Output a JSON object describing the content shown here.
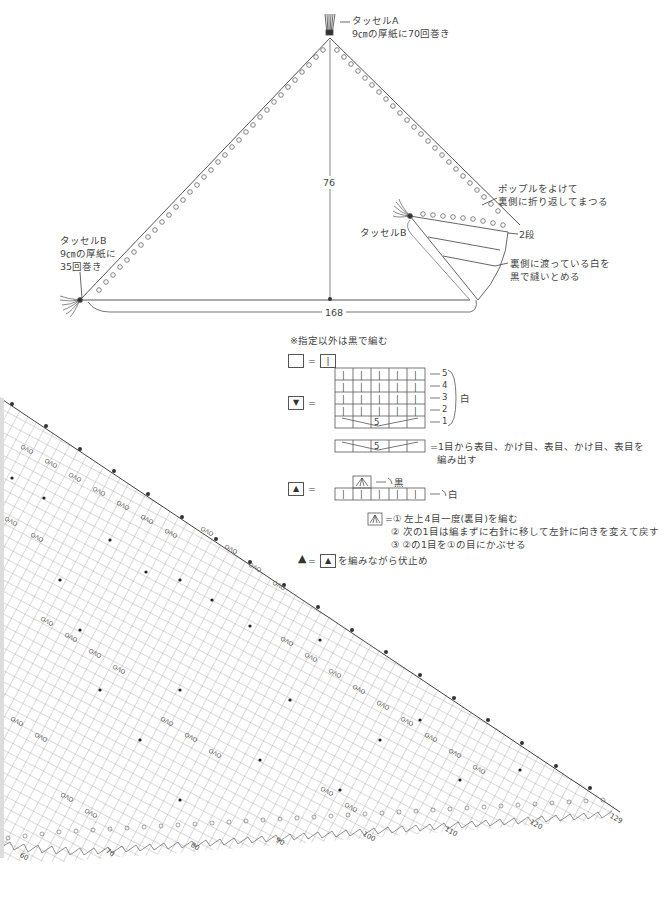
{
  "schematic": {
    "tassel_a": {
      "title": "タッセルA",
      "note": "9㎝の厚紙に70回巻き"
    },
    "tassel_b_left": {
      "title": "タッセルB",
      "note_line1": "9㎝の厚紙に",
      "note_line2": "35回巻き"
    },
    "tassel_b_right": {
      "title": "タッセルB"
    },
    "height_label": "76",
    "width_label": "168",
    "annotation_popcorn_line1": "ポップルをよけて",
    "annotation_popcorn_line2": "裏側に折り返してまつる",
    "annotation_rows": "2段",
    "annotation_white_line1": "裏側に渡っている白を",
    "annotation_white_line2": "黒で縫いとめる"
  },
  "legend": {
    "note": "※指定以外は黒で編む",
    "equals": "=",
    "blank_symbol_meaning": "|",
    "down_triangle_symbol": "▼",
    "up_triangle_symbol": "▲",
    "white_label": "白",
    "black_label": "黒",
    "row_numbers": [
      "5",
      "4",
      "3",
      "2",
      "1"
    ],
    "increase_number": "5",
    "increase_desc_line1": "=1目から表目、かけ目、表目、かけ目、表目を",
    "increase_desc_line2": "編み出す",
    "decrease_step1": "=① 左上4目一度(裏目)を編む",
    "decrease_step2": "② 次の1目は編まずに右針に移して左針に向きを変えて戻す",
    "decrease_step3": "③ ②の1目を①の目にかぶせる",
    "bindoff_desc": "を編みながら伏止め"
  },
  "chart": {
    "bottom_ticks": [
      "60",
      "70",
      "80",
      "90",
      "100",
      "110",
      "120",
      "129"
    ],
    "motif_text": "OΛO"
  }
}
